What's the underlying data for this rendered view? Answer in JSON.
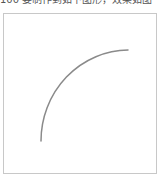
{
  "caption": {
    "text": "100 要制作到如下图形，效果如图"
  },
  "frame": {
    "border_color": "#c8c8c8"
  },
  "arc": {
    "start": [
      41,
      141
    ],
    "end": [
      128,
      50
    ],
    "rx": 88,
    "ry": 91,
    "stroke_color": "#8a8a8a",
    "stroke_width": 1.5
  }
}
